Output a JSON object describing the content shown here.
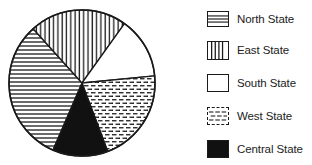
{
  "chart_data": {
    "type": "pie",
    "title": "",
    "categories": [
      "North State",
      "East State",
      "South State",
      "West State",
      "Central State"
    ],
    "values": [
      32,
      21.5,
      13.5,
      21,
      12
    ],
    "unit": "percent (estimated from slice angles)",
    "slices": [
      {
        "label": "North State",
        "value": 32,
        "pattern": "horizontal-lines",
        "start_deg": 132,
        "end_deg": 246.6
      },
      {
        "label": "East State",
        "value": 21.5,
        "pattern": "vertical-lines",
        "start_deg": 54.4,
        "end_deg": 132
      },
      {
        "label": "South State",
        "value": 13.5,
        "pattern": "blank",
        "start_deg": 5.6,
        "end_deg": 54.4
      },
      {
        "label": "West State",
        "value": 21,
        "pattern": "dashed-horizontal",
        "start_deg": 290.6,
        "end_deg": 365.6
      },
      {
        "label": "Central State",
        "value": 12,
        "pattern": "solid-black",
        "start_deg": 246.6,
        "end_deg": 290.6
      }
    ],
    "legend_position": "right",
    "grid": false,
    "colors": {
      "ink": "#1a1a1a",
      "background": "#ffffff"
    }
  },
  "legend": {
    "items": [
      {
        "label": "North State",
        "pattern": "horizontal-lines"
      },
      {
        "label": "East State",
        "pattern": "vertical-lines"
      },
      {
        "label": "South State",
        "pattern": "blank"
      },
      {
        "label": "West State",
        "pattern": "dashed-horizontal"
      },
      {
        "label": "Central State",
        "pattern": "solid-black"
      }
    ]
  }
}
